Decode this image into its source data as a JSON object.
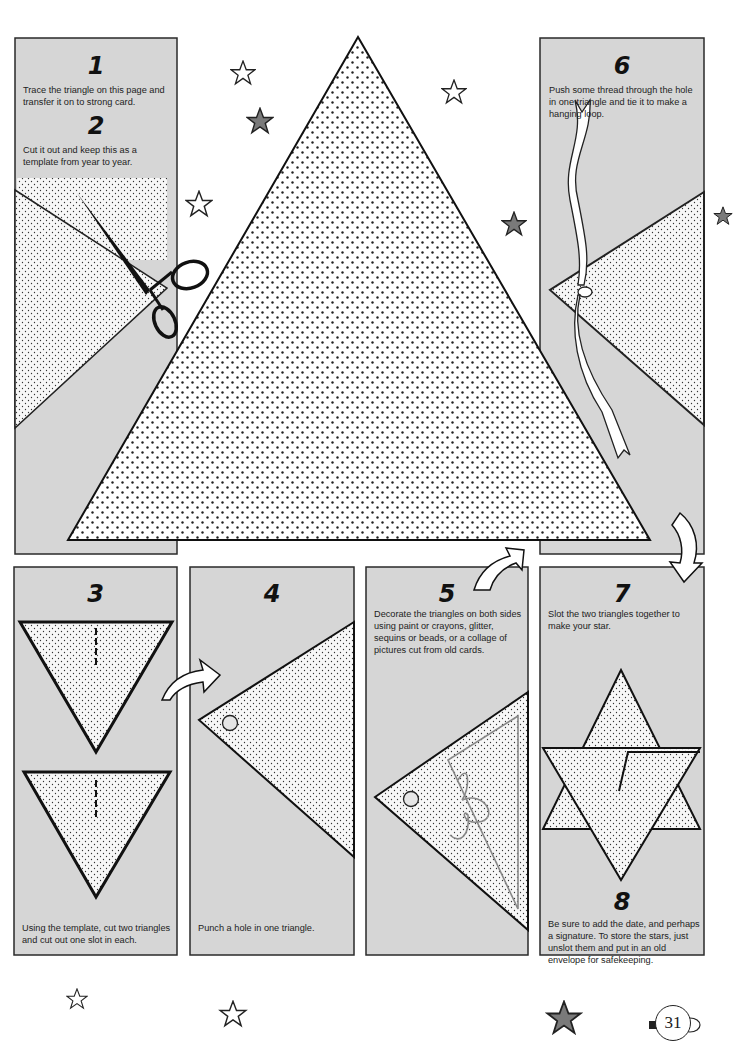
{
  "page": {
    "number": "31",
    "colors": {
      "panel_gray": "#d6d6d6",
      "border": "#2a2a2a",
      "star_fill": "#7a7a7a",
      "dot_pattern": "#222222"
    }
  },
  "steps": [
    {
      "number": "1",
      "text": "Trace the triangle on this page and transfer it on to strong card."
    },
    {
      "number": "2",
      "text": "Cut it out and keep this as a template from year to year."
    },
    {
      "number": "3",
      "text": "Using the template, cut two triangles and cut out one slot in each."
    },
    {
      "number": "4",
      "text": "Punch a hole in one triangle."
    },
    {
      "number": "5",
      "text": "Decorate the triangles on both sides using paint or crayons, glitter, sequins or beads, or a collage of pictures cut from old cards."
    },
    {
      "number": "6",
      "text": "Push some thread through the hole in one triangle and tie it to make a hanging loop."
    },
    {
      "number": "7",
      "text": "Slot the two triangles together to make your star."
    },
    {
      "number": "8",
      "text": "Be sure to add the date, and perhaps a signature. To store the stars, just unslot them and put in an old envelope for safekeeping."
    }
  ],
  "illustrations": {
    "template_triangle": "large-dotted-triangle-template",
    "step2": "scissors-cutting-card",
    "step3": "two-triangles-with-slots",
    "step4": "triangle-with-punched-hole",
    "step5": "decorated-triangle",
    "step6": "triangle-with-ribbon-loop",
    "step7": "assembled-star",
    "arrows": [
      "arrow-3-to-4",
      "arrow-5-to-6",
      "arrow-6-to-7"
    ],
    "stars": [
      "outline-star",
      "filled-star"
    ]
  }
}
